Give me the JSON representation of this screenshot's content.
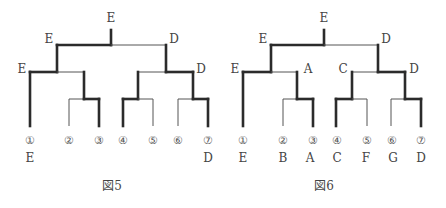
{
  "figures": [
    {
      "caption": "図5",
      "node_labels": {
        "root": "E",
        "left": "E",
        "right": "D",
        "left_left": "E",
        "left_right": "",
        "right_left": "",
        "right_right": "D"
      },
      "leaves": [
        {
          "number": "①",
          "letter": "E"
        },
        {
          "number": "②",
          "letter": ""
        },
        {
          "number": "③",
          "letter": ""
        },
        {
          "number": "④",
          "letter": ""
        },
        {
          "number": "⑤",
          "letter": ""
        },
        {
          "number": "⑥",
          "letter": ""
        },
        {
          "number": "⑦",
          "letter": "D"
        }
      ]
    },
    {
      "caption": "図6",
      "node_labels": {
        "root": "E",
        "left": "E",
        "right": "D",
        "left_left": "E",
        "left_right": "A",
        "right_left": "C",
        "right_right": "D"
      },
      "leaves": [
        {
          "number": "①",
          "letter": "E"
        },
        {
          "number": "②",
          "letter": "B"
        },
        {
          "number": "③",
          "letter": "A"
        },
        {
          "number": "④",
          "letter": "C"
        },
        {
          "number": "⑤",
          "letter": "F"
        },
        {
          "number": "⑥",
          "letter": "G"
        },
        {
          "number": "⑦",
          "letter": "D"
        }
      ]
    }
  ],
  "colors": {
    "line_thick": "#2b2b2b",
    "line_thin": "#555555",
    "text": "#444444"
  }
}
